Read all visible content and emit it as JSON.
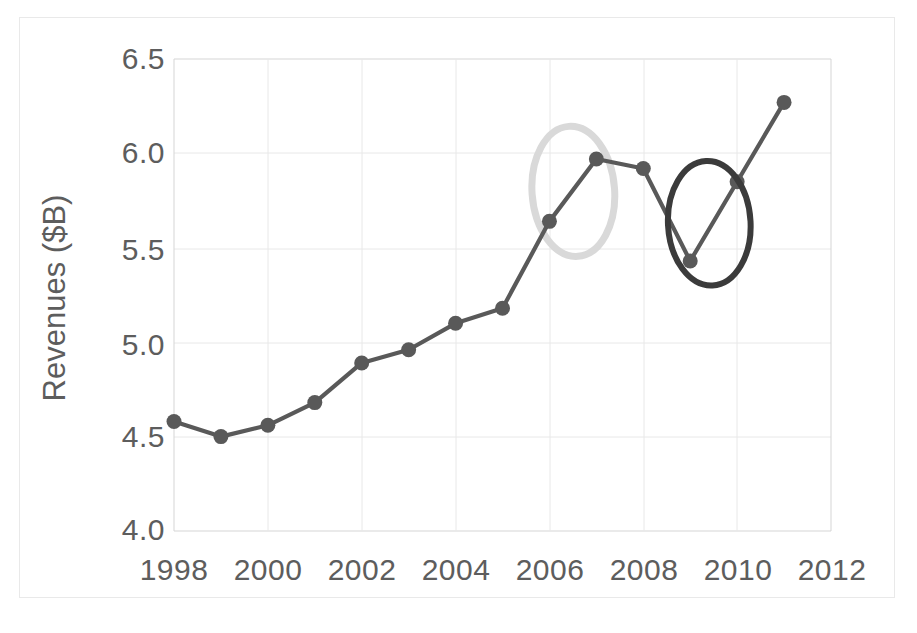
{
  "chart_data": {
    "type": "line",
    "title": "",
    "xlabel": "",
    "ylabel": "Revenues ($B)",
    "xlim": [
      1998,
      2012
    ],
    "ylim": [
      4.0,
      6.5
    ],
    "grid": true,
    "legend": "none",
    "x": [
      1998,
      1999,
      2000,
      2001,
      2002,
      2003,
      2004,
      2005,
      2006,
      2007,
      2008,
      2009,
      2010,
      2011
    ],
    "values": [
      4.58,
      4.5,
      4.56,
      4.68,
      4.89,
      4.96,
      5.1,
      5.18,
      5.64,
      5.97,
      5.92,
      5.43,
      5.85,
      6.27
    ],
    "series": [
      {
        "name": "Revenues",
        "values": [
          4.58,
          4.5,
          4.56,
          4.68,
          4.89,
          4.96,
          5.1,
          5.18,
          5.64,
          5.97,
          5.92,
          5.43,
          5.85,
          6.27
        ]
      }
    ],
    "ytick_labels": [
      "6.5",
      "6.0",
      "5.5",
      "5.0",
      "4.5",
      "4.0"
    ],
    "ytick_values": [
      6.5,
      6.0,
      5.5,
      5.0,
      4.5,
      4.0
    ],
    "xtick_labels": [
      "1998",
      "2000",
      "2002",
      "2004",
      "2006",
      "2008",
      "2010",
      "2012"
    ],
    "xtick_values": [
      1998,
      2000,
      2002,
      2004,
      2006,
      2008,
      2010,
      2012
    ],
    "annotations": [
      {
        "name": "light-highlight-ellipse",
        "shape": "ellipse",
        "color": "#d9d9d9",
        "center_x": 2006.5,
        "center_y": 5.8,
        "x_radius_years": 0.88,
        "y_radius_value": 0.345,
        "highlights": "2006-2007 revenue increase"
      },
      {
        "name": "dark-highlight-ellipse",
        "shape": "ellipse",
        "color": "#3b3b3b",
        "center_x": 2009.4,
        "center_y": 5.63,
        "x_radius_years": 0.88,
        "y_radius_value": 0.33,
        "highlights": "2009 dip and 2010 recovery"
      }
    ],
    "colors": {
      "line": "#595959",
      "marker": "#595959",
      "grid": "#e8e8e8",
      "axis_border": "#d5d5d5",
      "tick_text": "#5d5d5d",
      "light_ellipse": "#d9d9d9",
      "dark_ellipse": "#3b3b3b",
      "background": "#ffffff"
    }
  }
}
